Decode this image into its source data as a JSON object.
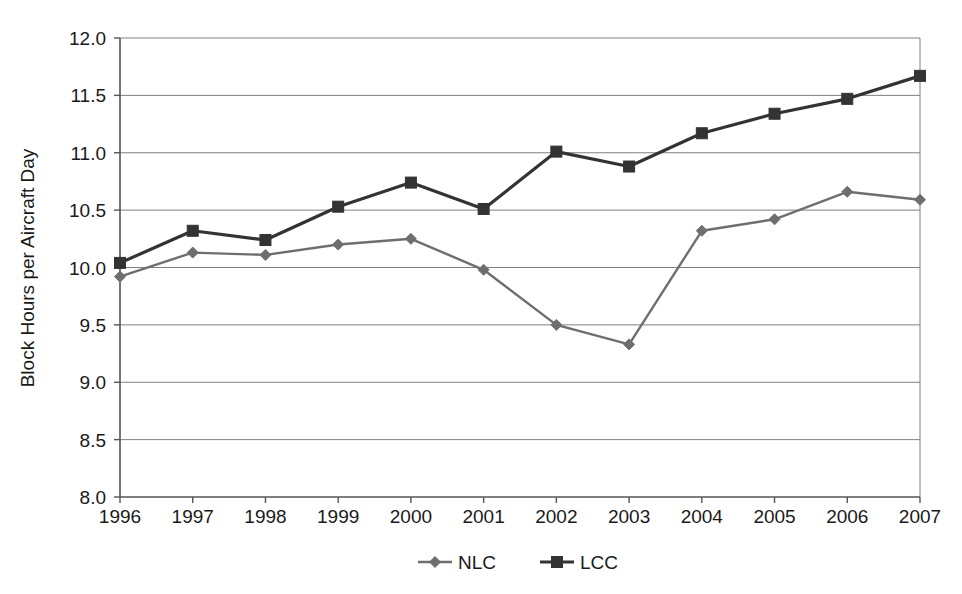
{
  "chart_data": {
    "type": "line",
    "title": "",
    "xlabel": "",
    "ylabel": "Block Hours per Aircraft Day",
    "categories": [
      "1996",
      "1997",
      "1998",
      "1999",
      "2000",
      "2001",
      "2002",
      "2003",
      "2004",
      "2005",
      "2006",
      "2007"
    ],
    "x": [
      1996,
      1997,
      1998,
      1999,
      2000,
      2001,
      2002,
      2003,
      2004,
      2005,
      2006,
      2007
    ],
    "series": [
      {
        "name": "NLC",
        "marker": "diamond",
        "color": "#6e6e6e",
        "values": [
          9.92,
          10.13,
          10.11,
          10.2,
          10.25,
          9.98,
          9.5,
          9.33,
          10.32,
          10.42,
          10.66,
          10.59
        ]
      },
      {
        "name": "LCC",
        "marker": "square",
        "color": "#333333",
        "values": [
          10.04,
          10.32,
          10.24,
          10.53,
          10.74,
          10.51,
          11.01,
          10.88,
          11.17,
          11.34,
          11.47,
          11.67
        ]
      }
    ],
    "ylim": [
      8.0,
      12.0
    ],
    "yticks": [
      8.0,
      8.5,
      9.0,
      9.5,
      10.0,
      10.5,
      11.0,
      11.5,
      12.0
    ],
    "ytick_labels": [
      "8.0",
      "8.5",
      "9.0",
      "9.5",
      "10.0",
      "10.5",
      "11.0",
      "11.5",
      "12.0"
    ],
    "grid": "horizontal",
    "legend_position": "bottom",
    "gridline_color": "#808080",
    "axis_color": "#555555",
    "background": "#ffffff"
  },
  "legend": {
    "items": [
      {
        "label": "NLC"
      },
      {
        "label": "LCC"
      }
    ]
  },
  "axes": {
    "y_title": "Block Hours per Aircraft Day"
  }
}
